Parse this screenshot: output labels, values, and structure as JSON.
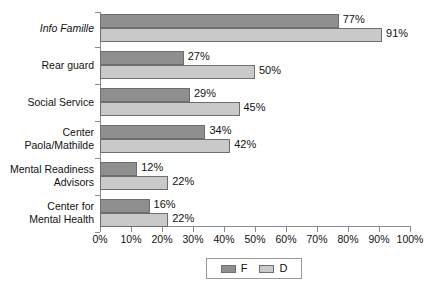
{
  "chart_data": {
    "type": "bar",
    "orientation": "horizontal",
    "title": "",
    "subtitle": "",
    "xlabel": "",
    "ylabel": "",
    "xlim": [
      0,
      100
    ],
    "xtick_step": 10,
    "xticks": [
      "0%",
      "10%",
      "20%",
      "30%",
      "40%",
      "50%",
      "60%",
      "70%",
      "80%",
      "90%",
      "100%"
    ],
    "grid": false,
    "legend_position": "bottom-center",
    "value_suffix": "%",
    "categories": [
      "Info Famille",
      "Rear guard",
      "Social Service",
      "Center\nPaola/Mathilde",
      "Mental Readiness\nAdvisors",
      "Center for\nMental Health"
    ],
    "series": [
      {
        "name": "F",
        "color": "#8f8f8f",
        "values": [
          77,
          27,
          29,
          34,
          12,
          16
        ],
        "labels": [
          "77%",
          "27%",
          "29%",
          "34%",
          "12%",
          "16%"
        ]
      },
      {
        "name": "D",
        "color": "#c9c9c9",
        "values": [
          91,
          50,
          45,
          42,
          22,
          22
        ],
        "labels": [
          "91%",
          "50%",
          "45%",
          "42%",
          "22%",
          "22%"
        ]
      }
    ]
  },
  "categories_display": [
    {
      "lines": [
        "Info Famille"
      ],
      "italic": true
    },
    {
      "lines": [
        "Rear guard"
      ],
      "italic": false
    },
    {
      "lines": [
        "Social Service"
      ],
      "italic": false
    },
    {
      "lines": [
        "Center",
        "Paola/Mathilde"
      ],
      "italic": false
    },
    {
      "lines": [
        "Mental Readiness",
        "Advisors"
      ],
      "italic": false
    },
    {
      "lines": [
        "Center for",
        "Mental Health"
      ],
      "italic": false
    }
  ],
  "legend": {
    "entries": [
      {
        "label": "F",
        "color": "#8f8f8f"
      },
      {
        "label": "D",
        "color": "#c9c9c9"
      }
    ]
  },
  "axis": {
    "x_min_label": "0%",
    "x_max_label": "100%"
  }
}
